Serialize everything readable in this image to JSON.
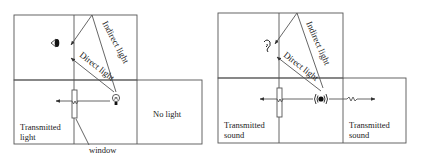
{
  "left_diagram": {
    "indirect_label": "Indirect light",
    "direct_label": "Direct light",
    "transmitted_label_line1": "Transmitted",
    "transmitted_label_line2": "light",
    "no_light_label": "No light",
    "window_label": "window",
    "receiver_icon": "eye-icon",
    "source_icon": "light-bulb-icon"
  },
  "right_diagram": {
    "indirect_label": "Indirect light",
    "direct_label": "Direct light",
    "transmitted_left_line1": "Transmitted",
    "transmitted_left_line2": "sound",
    "transmitted_right_line1": "Transmitted",
    "transmitted_right_line2": "sound",
    "receiver_icon": "ear-icon",
    "source_icon": "speaker-icon"
  },
  "colors": {
    "line": "#555555",
    "text": "#222222",
    "background": "#ffffff"
  }
}
